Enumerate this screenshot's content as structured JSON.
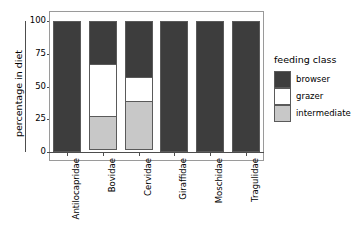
{
  "chart_data": {
    "type": "bar",
    "title": "",
    "subtitle": "",
    "stacked": true,
    "orientation": "vertical",
    "xlabel": "",
    "ylabel": "percentage in diet",
    "ylim": [
      0,
      100
    ],
    "yticks": [
      0,
      25,
      50,
      75,
      100
    ],
    "ytick_labels": [
      "0",
      "25",
      "50",
      "75",
      "100"
    ],
    "grid": false,
    "legend_position": "right",
    "legend_title": "feeding class",
    "categories": [
      "Antilocapridae",
      "Bovidae",
      "Cervidae",
      "Giraffidae",
      "Moschidae",
      "Tragulidae"
    ],
    "series": [
      {
        "name": "browser",
        "color": "#3d3d3d",
        "values": [
          100,
          33.6,
          43.5,
          100,
          100,
          100
        ]
      },
      {
        "name": "grazer",
        "color": "#ffffff",
        "values": [
          0,
          40.5,
          19.1,
          0,
          0,
          0
        ]
      },
      {
        "name": "intermediate",
        "color": "#c8c8c8",
        "values": [
          0,
          25.9,
          37.4,
          0,
          0,
          0
        ]
      }
    ]
  },
  "legend": {
    "title": "feeding class",
    "items": [
      {
        "label": "browser",
        "color": "#3d3d3d"
      },
      {
        "label": "grazer",
        "color": "#ffffff"
      },
      {
        "label": "intermediate",
        "color": "#c8c8c8"
      }
    ]
  },
  "axes": {
    "y_title": "percentage in diet",
    "y_ticks": [
      "100",
      "75",
      "50",
      "25",
      "0"
    ],
    "x_ticks": [
      "Antilocapridae",
      "Bovidae",
      "Cervidae",
      "Giraffidae",
      "Moschidae",
      "Tragulidae"
    ]
  },
  "colors": {
    "browser": "#3d3d3d",
    "grazer": "#ffffff",
    "intermediate": "#c8c8c8",
    "axis": "#4d4d4d",
    "panel_border": "#9a9a9a",
    "bar_border": "#5a5a5a",
    "background": "#ffffff"
  }
}
